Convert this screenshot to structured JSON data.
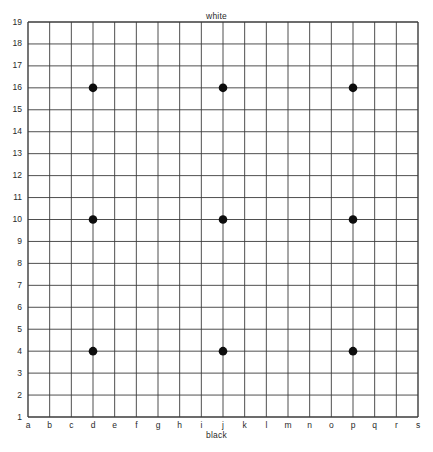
{
  "figure": {
    "title_top": "white",
    "title_bottom": "black"
  },
  "board": {
    "size": 19,
    "line_color": "#3b3b3b",
    "stone_color": "#0d0d0d",
    "background": "#ffffff",
    "column_labels": [
      "a",
      "b",
      "c",
      "d",
      "e",
      "f",
      "g",
      "h",
      "i",
      "j",
      "k",
      "l",
      "m",
      "n",
      "o",
      "p",
      "q",
      "r",
      "s"
    ],
    "row_labels": [
      "19",
      "18",
      "17",
      "16",
      "15",
      "14",
      "13",
      "12",
      "11",
      "10",
      "9",
      "8",
      "7",
      "6",
      "5",
      "4",
      "3",
      "2",
      "1"
    ]
  },
  "chart_data": {
    "type": "scatter",
    "title": "white",
    "xlabel": "black",
    "ylabel": "",
    "grid": true,
    "xlim": [
      1,
      19
    ],
    "ylim": [
      1,
      19
    ],
    "x_tick_labels": [
      "a",
      "b",
      "c",
      "d",
      "e",
      "f",
      "g",
      "h",
      "i",
      "j",
      "k",
      "l",
      "m",
      "n",
      "o",
      "p",
      "q",
      "r",
      "s"
    ],
    "y_tick_labels": [
      "1",
      "2",
      "3",
      "4",
      "5",
      "6",
      "7",
      "8",
      "9",
      "10",
      "11",
      "12",
      "13",
      "14",
      "15",
      "16",
      "17",
      "18",
      "19"
    ],
    "series": [
      {
        "name": "black stones",
        "marker": "filled-circle",
        "color": "#0d0d0d",
        "points": [
          {
            "col": "d",
            "row": 16,
            "x": 4,
            "y": 16
          },
          {
            "col": "j",
            "row": 16,
            "x": 10,
            "y": 16
          },
          {
            "col": "p",
            "row": 16,
            "x": 16,
            "y": 16
          },
          {
            "col": "d",
            "row": 10,
            "x": 4,
            "y": 10
          },
          {
            "col": "j",
            "row": 10,
            "x": 10,
            "y": 10
          },
          {
            "col": "p",
            "row": 10,
            "x": 16,
            "y": 10
          },
          {
            "col": "d",
            "row": 4,
            "x": 4,
            "y": 4
          },
          {
            "col": "j",
            "row": 4,
            "x": 10,
            "y": 4
          },
          {
            "col": "p",
            "row": 4,
            "x": 16,
            "y": 4
          }
        ]
      }
    ]
  }
}
